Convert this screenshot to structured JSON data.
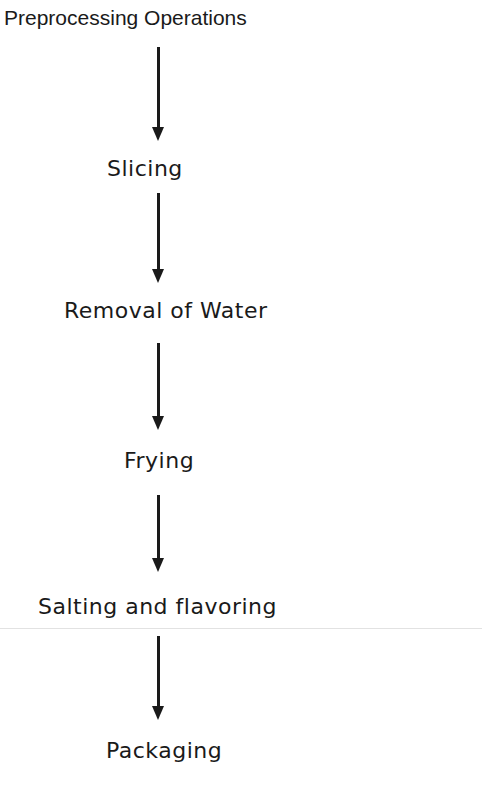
{
  "flowchart": {
    "steps": [
      {
        "label": "Preprocessing Operations"
      },
      {
        "label": "Slicing"
      },
      {
        "label": "Removal of Water"
      },
      {
        "label": "Frying"
      },
      {
        "label": "Salting and flavoring"
      },
      {
        "label": "Packaging"
      }
    ],
    "arrow_icon": "down-arrow-icon",
    "ink_color": "#1a1a1a"
  }
}
